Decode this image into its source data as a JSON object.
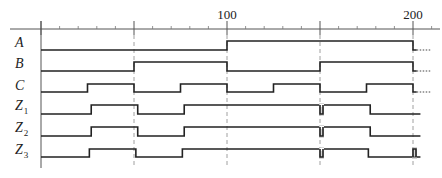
{
  "axis": {
    "labels": [
      {
        "value": "100",
        "t": 100
      },
      {
        "value": "200",
        "t": 200
      }
    ],
    "t_min": 0,
    "t_max": 205,
    "minor_tick_step": 10,
    "major_ticks": [
      0,
      50,
      100,
      150,
      200
    ],
    "dashed_guides": [
      50,
      100,
      150,
      200
    ]
  },
  "signals": [
    {
      "name": "A",
      "sub": ""
    },
    {
      "name": "B",
      "sub": ""
    },
    {
      "name": "C",
      "sub": ""
    },
    {
      "name": "Z",
      "sub": "1"
    },
    {
      "name": "Z",
      "sub": "2"
    },
    {
      "name": "Z",
      "sub": "3"
    }
  ],
  "chart_data": {
    "type": "timing-diagram",
    "time_axis": {
      "ticks_labeled": [
        100,
        200
      ],
      "minor_step": 10,
      "range": [
        0,
        205
      ]
    },
    "waveforms": {
      "A": {
        "transitions": [
          [
            0,
            0
          ],
          [
            100,
            1
          ],
          [
            200,
            0
          ]
        ],
        "continues_dotted_after": 200
      },
      "B": {
        "transitions": [
          [
            0,
            0
          ],
          [
            50,
            1
          ],
          [
            100,
            0
          ],
          [
            150,
            1
          ],
          [
            200,
            0
          ]
        ],
        "continues_dotted_after": 200
      },
      "C": {
        "transitions": [
          [
            0,
            0
          ],
          [
            25,
            1
          ],
          [
            50,
            0
          ],
          [
            75,
            1
          ],
          [
            100,
            0
          ],
          [
            125,
            1
          ],
          [
            150,
            0
          ],
          [
            175,
            1
          ],
          [
            200,
            0
          ]
        ],
        "continues_dotted_after": 200
      },
      "Z1": {
        "transitions": [
          [
            0,
            0
          ],
          [
            27,
            1
          ],
          [
            52,
            0
          ],
          [
            77,
            1
          ],
          [
            177,
            0
          ]
        ],
        "glitches": [
          150
        ]
      },
      "Z2": {
        "transitions": [
          [
            0,
            0
          ],
          [
            27,
            1
          ],
          [
            52,
            0
          ],
          [
            77,
            1
          ],
          [
            177,
            0
          ]
        ],
        "glitches": [
          150
        ]
      },
      "Z3": {
        "transitions": [
          [
            0,
            0
          ],
          [
            26,
            1
          ],
          [
            51,
            0
          ],
          [
            76,
            1
          ],
          [
            176,
            0
          ]
        ],
        "glitches": [
          150,
          200
        ]
      }
    }
  }
}
